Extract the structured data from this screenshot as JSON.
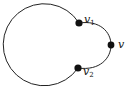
{
  "diagram": {
    "type": "graph",
    "vertices": [
      {
        "id": "v1",
        "label": "v",
        "subscript": "1"
      },
      {
        "id": "v2",
        "label": "v",
        "subscript": "2"
      },
      {
        "id": "v",
        "label": "v",
        "subscript": ""
      }
    ],
    "edges": [
      {
        "from": "v1",
        "to": "v2",
        "kind": "large-cycle-arc"
      },
      {
        "from": "v1",
        "to": "v",
        "kind": "ear-arc"
      },
      {
        "from": "v",
        "to": "v2",
        "kind": "ear-arc"
      }
    ],
    "colors": {
      "stroke": "#222222",
      "vertex": "#111111",
      "background": "#ffffff"
    }
  }
}
